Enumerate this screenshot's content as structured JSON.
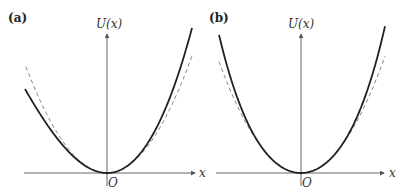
{
  "figure": {
    "panels": [
      {
        "label": "(a)",
        "y_axis_label": "U(x)",
        "x_axis_label": "x",
        "origin_label": "O",
        "description": "Asymmetric anharmonic potential (solid) vs harmonic parabola (dashed)"
      },
      {
        "label": "(b)",
        "y_axis_label": "U(x)",
        "x_axis_label": "x",
        "origin_label": "O",
        "description": "Symmetric anharmonic potential (solid) vs harmonic parabola (dashed)"
      }
    ]
  },
  "chart_data": [
    {
      "type": "line",
      "title": "(a)",
      "xlabel": "x",
      "ylabel": "U(x)",
      "grid": false,
      "series": [
        {
          "name": "U(x) anharmonic (solid)",
          "style": "solid",
          "form": "a*x^2 + b*x^3",
          "x": [
            -1.0,
            -0.75,
            -0.5,
            -0.25,
            0,
            0.25,
            0.5,
            0.75,
            1.0
          ],
          "values": [
            0.58,
            0.37,
            0.19,
            0.05,
            0,
            0.06,
            0.25,
            0.59,
            1.0
          ]
        },
        {
          "name": "harmonic approximation (dashed)",
          "style": "dashed",
          "form": "k*x^2",
          "x": [
            -1.0,
            -0.75,
            -0.5,
            -0.25,
            0,
            0.25,
            0.5,
            0.75,
            1.0
          ],
          "values": [
            0.76,
            0.43,
            0.19,
            0.05,
            0,
            0.05,
            0.2,
            0.45,
            0.81
          ]
        }
      ]
    },
    {
      "type": "line",
      "title": "(b)",
      "xlabel": "x",
      "ylabel": "U(x)",
      "grid": false,
      "series": [
        {
          "name": "U(x) anharmonic (solid)",
          "style": "solid",
          "form": "a*x^2 + c*x^4",
          "x": [
            -1.0,
            -0.75,
            -0.5,
            -0.25,
            0,
            0.25,
            0.5,
            0.75,
            1.0
          ],
          "values": [
            0.96,
            0.5,
            0.2,
            0.05,
            0,
            0.05,
            0.2,
            0.52,
            1.0
          ]
        },
        {
          "name": "harmonic approximation (dashed)",
          "style": "dashed",
          "form": "k*x^2",
          "x": [
            -1.0,
            -0.75,
            -0.5,
            -0.25,
            0,
            0.25,
            0.5,
            0.75,
            1.0
          ],
          "values": [
            0.77,
            0.43,
            0.19,
            0.05,
            0,
            0.05,
            0.19,
            0.45,
            0.8
          ]
        }
      ]
    }
  ]
}
